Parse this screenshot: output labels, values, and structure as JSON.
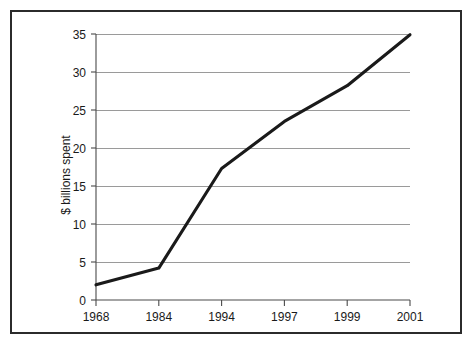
{
  "chart_data": {
    "type": "line",
    "title": "",
    "subtitle": "",
    "xlabel": "",
    "ylabel": "$ billions spent",
    "categories": [
      "1968",
      "1984",
      "1994",
      "1997",
      "1999",
      "2001"
    ],
    "x": [
      1968,
      1984,
      1994,
      1997,
      1999,
      2001
    ],
    "values": [
      2.0,
      4.2,
      17.3,
      23.5,
      28.2,
      34.9
    ],
    "series": [
      {
        "name": "$ billions spent",
        "values": [
          2.0,
          4.2,
          17.3,
          23.5,
          28.2,
          34.9
        ],
        "color": "#1a1a1a"
      }
    ],
    "ylim": [
      0,
      35
    ],
    "yticks": [
      0,
      5,
      10,
      15,
      20,
      25,
      30,
      35
    ],
    "ytick_labels": [
      "0",
      "5",
      "10",
      "15",
      "20",
      "25",
      "30",
      "35"
    ],
    "xtick_labels": [
      "1968",
      "1984",
      "1994",
      "1997",
      "1999",
      "2001"
    ],
    "grid": "horizontal",
    "grid_color": "#9a9a9a",
    "legend": "none",
    "annotations": [],
    "axis_color": "#4a4a4a",
    "frame_color": "#2b2b2b",
    "background": "#ffffff"
  }
}
